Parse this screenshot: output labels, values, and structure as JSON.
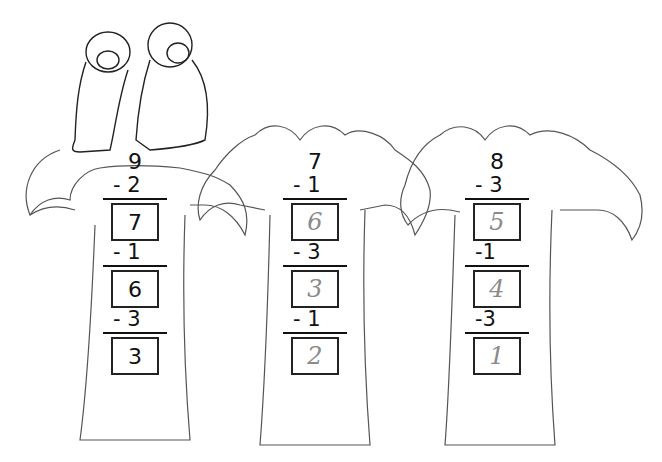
{
  "worksheet": {
    "illustration": "two-monkeys-on-palm-trees",
    "trees": [
      {
        "start": "9",
        "steps": [
          {
            "op": "- 2",
            "answer": "7",
            "style": "printed"
          },
          {
            "op": "- 1",
            "answer": "6",
            "style": "printed"
          },
          {
            "op": "- 3",
            "answer": "3",
            "style": "printed"
          }
        ]
      },
      {
        "start": "7",
        "steps": [
          {
            "op": "- 1",
            "answer": "6",
            "style": "handwritten"
          },
          {
            "op": "- 3",
            "answer": "3",
            "style": "handwritten"
          },
          {
            "op": "- 1",
            "answer": "2",
            "style": "handwritten"
          }
        ]
      },
      {
        "start": "8",
        "steps": [
          {
            "op": "- 3",
            "answer": "5",
            "style": "handwritten"
          },
          {
            "op": "-1",
            "answer": "4",
            "style": "handwritten"
          },
          {
            "op": "-3",
            "answer": "1",
            "style": "handwritten"
          }
        ]
      }
    ]
  }
}
